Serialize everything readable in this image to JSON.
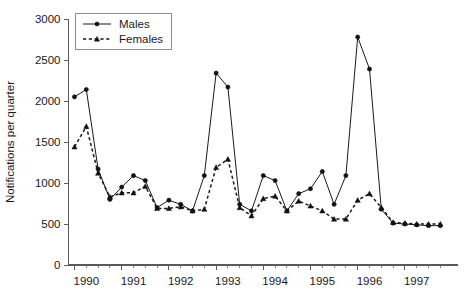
{
  "chart_data": {
    "type": "line",
    "title": "",
    "xlabel": "",
    "ylabel": "Notifications per quarter",
    "ylim": [
      0,
      3000
    ],
    "ytick_values": [
      0,
      500,
      1000,
      1500,
      2000,
      2500,
      3000
    ],
    "ytick_labels": [
      "0",
      "500",
      "1000",
      "1500",
      "2000",
      "2500",
      "3000"
    ],
    "xtick_labels": [
      "1990",
      "1991",
      "1992",
      "1993",
      "1994",
      "1995",
      "1996",
      "1997"
    ],
    "x_period": "quarter",
    "x": [
      "1990 Q1",
      "1990 Q2",
      "1990 Q3",
      "1990 Q4",
      "1991 Q1",
      "1991 Q2",
      "1991 Q3",
      "1991 Q4",
      "1992 Q1",
      "1992 Q2",
      "1992 Q3",
      "1992 Q4",
      "1993 Q1",
      "1993 Q2",
      "1993 Q3",
      "1993 Q4",
      "1994 Q1",
      "1994 Q2",
      "1994 Q3",
      "1994 Q4",
      "1995 Q1",
      "1995 Q2",
      "1995 Q3",
      "1995 Q4",
      "1996 Q1",
      "1996 Q2",
      "1996 Q3",
      "1996 Q4",
      "1997 Q1",
      "1997 Q2",
      "1997 Q3",
      "1997 Q4"
    ],
    "grid": false,
    "legend_position": "top-left",
    "series": [
      {
        "name": "Males",
        "marker": "filled-circle",
        "line_style": "solid",
        "values": [
          2050,
          2140,
          1170,
          800,
          950,
          1090,
          1030,
          700,
          790,
          740,
          660,
          1090,
          2340,
          2170,
          740,
          660,
          1090,
          1030,
          660,
          870,
          930,
          1140,
          740,
          1090,
          2780,
          2390,
          680,
          510,
          500,
          490,
          480,
          480
        ]
      },
      {
        "name": "Females",
        "marker": "filled-triangle",
        "line_style": "dashed",
        "values": [
          1440,
          1690,
          1120,
          830,
          880,
          880,
          960,
          690,
          690,
          710,
          660,
          680,
          1190,
          1290,
          700,
          600,
          810,
          840,
          660,
          780,
          720,
          660,
          560,
          560,
          790,
          870,
          700,
          520,
          510,
          500,
          500,
          500
        ]
      }
    ]
  },
  "legend": {
    "items": [
      {
        "label": "Males"
      },
      {
        "label": "Females"
      }
    ]
  },
  "axes": {
    "y_title": "Notifications per quarter"
  }
}
